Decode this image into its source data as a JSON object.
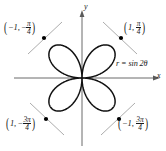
{
  "figure": {
    "type": "polar-rose-plot",
    "equation_label": "r = sin 2θ",
    "axis": {
      "x_label": "x",
      "y_label": "y",
      "origin_px": [
        82,
        78
      ],
      "x_axis_extent_px": [
        14,
        160
      ],
      "y_axis_extent_px": [
        10,
        146
      ]
    },
    "colors": {
      "background": "#ffffff",
      "curve": "#111111",
      "axis": "#555555",
      "tangent": "#8a8a8a",
      "point": "#000000",
      "text": "#1a1a1a"
    },
    "points": [
      {
        "id": "top-right",
        "open_paren": "(",
        "r": "1",
        "comma": ", ",
        "theta_sign": "",
        "theta_num": "π",
        "theta_den": "4",
        "close_paren": ")",
        "dot_px": [
          121,
          38
        ]
      },
      {
        "id": "top-left",
        "open_paren": "(",
        "r": "−1",
        "comma": ", ",
        "theta_sign": "−",
        "theta_num": "π",
        "theta_den": "4",
        "close_paren": ")",
        "dot_px": [
          44,
          38
        ]
      },
      {
        "id": "bottom-left",
        "open_paren": "(",
        "r": "1",
        "comma": ", ",
        "theta_sign": "−",
        "theta_num": "3π",
        "theta_den": "4",
        "close_paren": ")",
        "dot_px": [
          46,
          119
        ]
      },
      {
        "id": "bottom-right",
        "open_paren": "(",
        "r": "−1",
        "comma": ", ",
        "theta_sign": "",
        "theta_num": "3π",
        "theta_den": "4",
        "close_paren": ")",
        "dot_px": [
          119,
          119
        ]
      }
    ]
  },
  "chart_data": {
    "type": "line",
    "title": "",
    "subtitle": "",
    "curve_name": "r = sin 2θ",
    "coordinate_system": "polar",
    "xlabel": "x",
    "ylabel": "y",
    "xlim": [
      -1.6,
      1.6
    ],
    "ylim": [
      -1.5,
      1.5
    ],
    "grid": false,
    "legend": "none",
    "petal_count": 4,
    "max_radius": 1,
    "series": [
      {
        "name": "r = sin 2θ",
        "theta_deg": [
          0,
          15,
          30,
          45,
          60,
          75,
          90,
          105,
          120,
          135,
          150,
          165,
          180,
          195,
          210,
          225,
          240,
          255,
          270,
          285,
          300,
          315,
          330,
          345,
          360
        ],
        "r": [
          0,
          0.5,
          0.866,
          1,
          0.866,
          0.5,
          0,
          -0.5,
          -0.866,
          -1,
          -0.866,
          -0.5,
          0,
          0.5,
          0.866,
          1,
          0.866,
          0.5,
          0,
          -0.5,
          -0.866,
          -1,
          -0.866,
          -0.5,
          0
        ]
      }
    ],
    "annotations": [
      {
        "label": "(1, π/4)",
        "r": 1,
        "theta_deg": 45,
        "x": 0.707,
        "y": 0.707
      },
      {
        "label": "(−1, −π/4)",
        "r": -1,
        "theta_deg": -45,
        "x": -0.707,
        "y": 0.707
      },
      {
        "label": "(1, −3π/4)",
        "r": 1,
        "theta_deg": -135,
        "x": -0.707,
        "y": -0.707
      },
      {
        "label": "(−1, 3π/4)",
        "r": -1,
        "theta_deg": 135,
        "x": 0.707,
        "y": -0.707
      }
    ]
  }
}
